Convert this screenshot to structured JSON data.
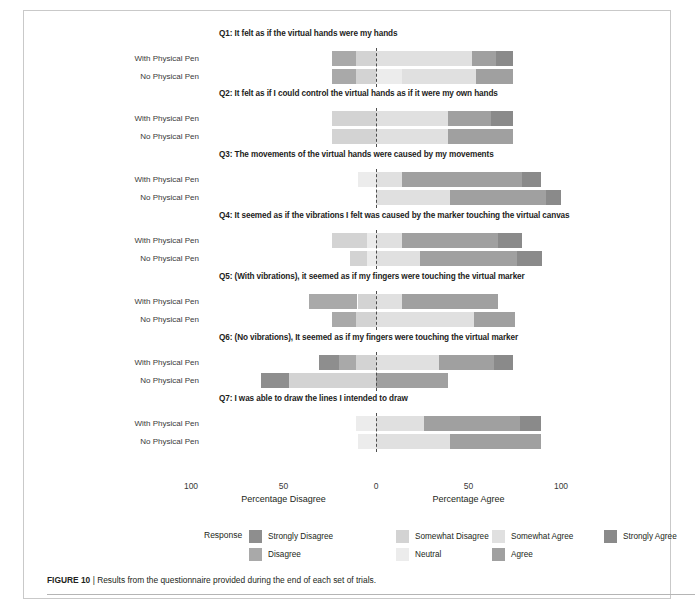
{
  "figure": {
    "caption_label": "FIGURE 10",
    "caption_sep": "|",
    "caption_text": "Results from the questionnaire provided during the end of each set of trials."
  },
  "axis": {
    "ticks": [
      {
        "label": "100",
        "value": -100
      },
      {
        "label": "50",
        "value": -50
      },
      {
        "label": "0",
        "value": 0
      },
      {
        "label": "50",
        "value": 50
      },
      {
        "label": "100",
        "value": 100
      }
    ],
    "left_title": "Percentage Disagree",
    "right_title": "Percentage Agree"
  },
  "legend": {
    "title": "Response",
    "items": [
      {
        "label": "Strongly Disagree",
        "color": "#8e8e8e"
      },
      {
        "label": "Disagree",
        "color": "#a9a9a9"
      },
      {
        "label": "Somewhat Disagree",
        "color": "#d3d3d3"
      },
      {
        "label": "Neutral",
        "color": "#ececec"
      },
      {
        "label": "Somewhat Agree",
        "color": "#e0e0e0"
      },
      {
        "label": "Agree",
        "color": "#a0a0a0"
      },
      {
        "label": "Strongly Agree",
        "color": "#8a8a8a"
      }
    ]
  },
  "row_labels": {
    "with_pen": "With Physical Pen",
    "no_pen": "No Physical Pen"
  },
  "chart_data": {
    "type": "bar",
    "subtype": "diverging-stacked-likert",
    "title": "",
    "xlabel": "Percentage Disagree / Percentage Agree",
    "ylabel": "",
    "xlim": [
      -100,
      100
    ],
    "grid": false,
    "legend_position": "bottom",
    "categories": [
      "Strongly Disagree",
      "Disagree",
      "Somewhat Disagree",
      "Neutral",
      "Somewhat Agree",
      "Agree",
      "Strongly Agree"
    ],
    "groups": [
      "With Physical Pen",
      "No Physical Pen"
    ],
    "questions": [
      {
        "id": "Q1",
        "text": "Q1: It felt as if the virtual hands were my hands",
        "rows": [
          {
            "group": "With Physical Pen",
            "start": -24,
            "values": [
              0,
              13,
              11,
              0,
              52,
              13,
              9
            ]
          },
          {
            "group": "No Physical Pen",
            "start": -24,
            "values": [
              0,
              13,
              11,
              14,
              40,
              20,
              0
            ]
          }
        ]
      },
      {
        "id": "Q2",
        "text": "Q2: It felt as if I could control the virtual hands as if it were my own hands",
        "rows": [
          {
            "group": "With Physical Pen",
            "start": -24,
            "values": [
              0,
              0,
              24,
              0,
              39,
              23,
              12
            ]
          },
          {
            "group": "No Physical Pen",
            "start": -24,
            "values": [
              0,
              0,
              24,
              0,
              39,
              35,
              0
            ]
          }
        ]
      },
      {
        "id": "Q3",
        "text": "Q3: The movements of the virtual hands were caused by my movements",
        "rows": [
          {
            "group": "With Physical Pen",
            "start": -10,
            "values": [
              0,
              0,
              0,
              10,
              14,
              65,
              10
            ]
          },
          {
            "group": "No Physical Pen",
            "start": 0,
            "values": [
              0,
              0,
              0,
              0,
              40,
              52,
              8
            ]
          }
        ]
      },
      {
        "id": "Q4",
        "text": "Q4: It seemed as if the vibrations I felt was caused by the marker touching the virtual canvas",
        "rows": [
          {
            "group": "With Physical Pen",
            "start": -24,
            "values": [
              0,
              0,
              19,
              5,
              14,
              52,
              13
            ]
          },
          {
            "group": "No Physical Pen",
            "start": -14,
            "values": [
              0,
              0,
              9,
              5,
              24,
              52,
              14
            ]
          }
        ]
      },
      {
        "id": "Q5",
        "text": "Q5: (With vibrations), it seemed as if my fingers were touching the virtual marker",
        "rows": [
          {
            "group": "With Physical Pen",
            "start": -36,
            "values": [
              0,
              26,
              10,
              0,
              14,
              52,
              0
            ]
          },
          {
            "group": "No Physical Pen",
            "start": -24,
            "values": [
              0,
              13,
              11,
              0,
              53,
              22,
              0
            ]
          }
        ]
      },
      {
        "id": "Q6",
        "text": "Q6: (No vibrations), It seemed as if my fingers were touching the virtual marker",
        "rows": [
          {
            "group": "With Physical Pen",
            "start": -31,
            "values": [
              11,
              9,
              11,
              0,
              34,
              30,
              10
            ]
          },
          {
            "group": "No Physical Pen",
            "start": -62,
            "values": [
              15,
              0,
              47,
              0,
              0,
              39,
              0
            ]
          }
        ]
      },
      {
        "id": "Q7",
        "text": "Q7: I was able to draw the lines I intended to draw",
        "rows": [
          {
            "group": "With Physical Pen",
            "start": -11,
            "values": [
              0,
              0,
              0,
              11,
              26,
              52,
              11
            ]
          },
          {
            "group": "No Physical Pen",
            "start": -10,
            "values": [
              0,
              0,
              0,
              10,
              40,
              49,
              0
            ]
          }
        ]
      }
    ]
  }
}
